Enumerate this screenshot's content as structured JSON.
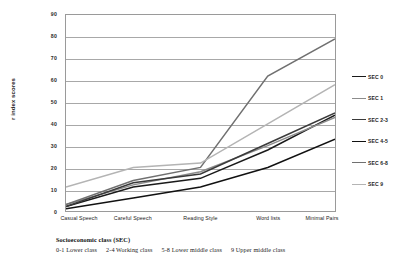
{
  "chart_data": {
    "type": "line",
    "title": "",
    "xlabel": "",
    "ylabel": "r index scores",
    "ylim": [
      0,
      90
    ],
    "ytick_step": 10,
    "yticks": [
      90,
      80,
      70,
      60,
      50,
      40,
      30,
      20,
      10,
      0
    ],
    "grid": true,
    "legend_position": "right",
    "categories": [
      "Casual Speech",
      "Careful Speech",
      "Reading Style",
      "Word lists",
      "Minimal Pairs"
    ],
    "series": [
      {
        "name": "SEC 0",
        "values": [
          2,
          11,
          15,
          28,
          44
        ],
        "color": "#1a1a1a"
      },
      {
        "name": "SEC 1",
        "values": [
          3,
          12,
          18,
          30,
          43
        ],
        "color": "#8c8c8c"
      },
      {
        "name": "SEC 2-3",
        "values": [
          2,
          13,
          17,
          31,
          45
        ],
        "color": "#3a3a3a"
      },
      {
        "name": "SEC 4-5",
        "values": [
          1,
          6,
          11,
          20,
          33
        ],
        "color": "#111111"
      },
      {
        "name": "SEC 6-8",
        "values": [
          3,
          14,
          20,
          62,
          79
        ],
        "color": "#707070"
      },
      {
        "name": "SEC 9",
        "values": [
          11,
          20,
          22,
          40,
          58
        ],
        "color": "#b4b4b4"
      }
    ]
  },
  "axis": {
    "y_title": "r index scores"
  },
  "caption": {
    "title": "Socioeconomic class (SEC)",
    "items": [
      "0-1 Lower class",
      "2-4 Working class",
      "5-8 Lower middle class",
      "9   Upper middle class"
    ]
  }
}
